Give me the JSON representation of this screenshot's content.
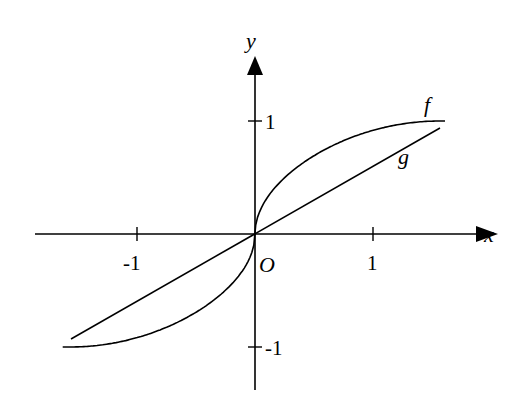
{
  "figure": {
    "axis_labels": {
      "x": "x",
      "y": "y",
      "origin": "O"
    },
    "x_ticks": [
      {
        "value": -1,
        "label": "-1"
      },
      {
        "value": 1,
        "label": "1"
      }
    ],
    "y_ticks": [
      {
        "value": 1,
        "label": "1"
      },
      {
        "value": -1,
        "label": "-1"
      }
    ],
    "curves": [
      {
        "name": "f",
        "label": "f",
        "description": "S-shaped curve through origin with vertical tangent, reaching y=1 at x≈1.6 and y=-1 at x≈-1.6"
      },
      {
        "name": "g",
        "label": "g",
        "description": "straight line through origin from about (-1.55,-0.93) to (1.55,0.93)"
      }
    ],
    "colors": {
      "stroke": "#000000",
      "background": "#ffffff"
    }
  },
  "chart_data": {
    "type": "line",
    "title": "",
    "xlabel": "x",
    "ylabel": "y",
    "xlim": [
      -1.65,
      1.6
    ],
    "ylim": [
      -1.3,
      1.6
    ],
    "grid": false,
    "series": [
      {
        "name": "f",
        "x": [
          -1.6,
          -1.2,
          -0.8,
          -0.4,
          -0.1,
          0,
          0.1,
          0.4,
          0.8,
          1.2,
          1.6
        ],
        "y": [
          -1.0,
          -0.97,
          -0.85,
          -0.62,
          -0.32,
          0,
          0.32,
          0.62,
          0.85,
          0.97,
          1.0
        ]
      },
      {
        "name": "g",
        "x": [
          -1.55,
          0,
          1.55
        ],
        "y": [
          -0.93,
          0,
          0.93
        ]
      }
    ]
  }
}
